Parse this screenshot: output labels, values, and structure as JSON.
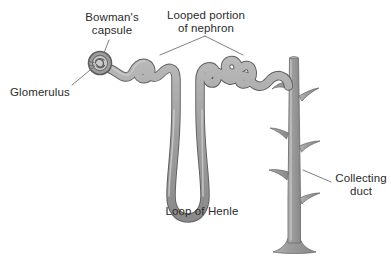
{
  "diagram": {
    "background_color": "#ffffff",
    "tubule_fill_color": "#9d9d9d",
    "tubule_outline_color": "#5a5a5a",
    "tubule_highlight_color": "#c8c8c8",
    "leader_line_color": "#6a6a6a",
    "text_color": "#2b2b2b",
    "labels": {
      "bowmans_capsule": "Bowman's\ncapsule",
      "looped_portion": "Looped portion\nof nephron",
      "glomerulus": "Glomerulus",
      "loop_of_henle": "Loop of Henle",
      "collecting_duct": "Collecting\nduct"
    },
    "structures": [
      {
        "name": "glomerulus",
        "description": "Small coiled capillary ball inside Bowman's capsule"
      },
      {
        "name": "bowmans-capsule",
        "description": "Cup-shaped sac enclosing the glomerulus at the start of the nephron"
      },
      {
        "name": "proximal-convoluted-tubule",
        "description": "Coiled tubule leading away from Bowman's capsule"
      },
      {
        "name": "loop-of-henle",
        "description": "Long hairpin loop descending deep and returning upward"
      },
      {
        "name": "distal-convoluted-tubule",
        "description": "Second coiled tubule region joining the collecting duct"
      },
      {
        "name": "collecting-duct",
        "description": "Vertical trunk with angled side branches, flaring at the base"
      }
    ]
  }
}
